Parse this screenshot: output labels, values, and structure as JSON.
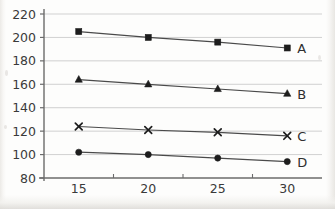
{
  "chart_data": {
    "type": "line",
    "title": "",
    "xlabel": "",
    "ylabel": "",
    "x": [
      15,
      20,
      25,
      30
    ],
    "xlim": [
      12.5,
      32.5
    ],
    "ylim": [
      80,
      220
    ],
    "xticks": [
      "15",
      "20",
      "25",
      "30"
    ],
    "yticks": [
      "80",
      "100",
      "120",
      "140",
      "160",
      "180",
      "200",
      "220"
    ],
    "grid": "horizontal",
    "legend_position": "right-of-line-end",
    "series": [
      {
        "name": "A",
        "marker": "square",
        "values": [
          205,
          200,
          196,
          191
        ]
      },
      {
        "name": "B",
        "marker": "triangle",
        "values": [
          164,
          160,
          156,
          152
        ]
      },
      {
        "name": "C",
        "marker": "cross",
        "values": [
          124,
          121,
          119,
          116
        ]
      },
      {
        "name": "D",
        "marker": "circle",
        "values": [
          102,
          100,
          97,
          94
        ]
      }
    ],
    "colors": {
      "line": "#4a4a4a",
      "marker": "#1d1d1d",
      "grid": "#cfcfcf",
      "axis": "#6b6b6b",
      "text": "#3a3a3a",
      "background": "#fdfdfc"
    }
  }
}
